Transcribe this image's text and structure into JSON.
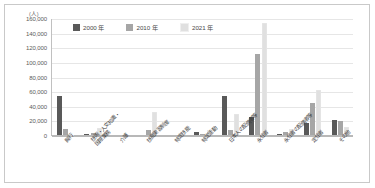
{
  "chart_data": {
    "type": "bar",
    "title": "",
    "xlabel": "",
    "ylabel": "",
    "yunit": "(人)",
    "ylim": [
      0,
      160000
    ],
    "ytick_step": 20000,
    "ytick_labels": [
      "160,000",
      "140,000",
      "120,000",
      "100,000",
      "80,000",
      "60,000",
      "40,000",
      "20,000",
      "0"
    ],
    "grid": true,
    "legend_position": "top-center",
    "categories": [
      "興行",
      "技術・人文知識・\n国際業務",
      "介護",
      "技能実習制度",
      "特定技能",
      "特定活動",
      "日本人の配偶者等",
      "永住者",
      "永住者の配偶者等",
      "定住者",
      "その他"
    ],
    "series": [
      {
        "name": "2000 年",
        "color": "#595959",
        "values": [
          53000,
          1500,
          0,
          0,
          0,
          3500,
          53500,
          24500,
          1000,
          16000,
          21000
        ]
      },
      {
        "name": "2010 年",
        "color": "#a6a6a6",
        "values": [
          8500,
          2500,
          0,
          7500,
          0,
          2000,
          7000,
          110500,
          3500,
          43500,
          19500
        ]
      },
      {
        "name": "2021 年",
        "color": "#e0e0e0",
        "values": [
          300,
          9500,
          500,
          32000,
          1200,
          7500,
          28500,
          153500,
          8500,
          62000,
          10500
        ]
      }
    ]
  },
  "axis": {
    "y_unit_label": "(人)"
  }
}
